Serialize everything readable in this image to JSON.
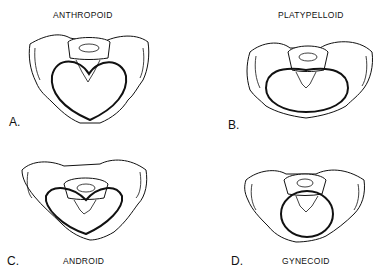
{
  "figure": {
    "panels": [
      {
        "letter": "A.",
        "title": "ANTHROPOID",
        "inlet_shape": "heart-shaped / oval anteroposterior"
      },
      {
        "letter": "B.",
        "title": "PLATYPELLOID",
        "inlet_shape": "wide transverse oval"
      },
      {
        "letter": "C.",
        "title": "ANDROID",
        "inlet_shape": "heart-shaped / triangular"
      },
      {
        "letter": "D.",
        "title": "GYNECOID",
        "inlet_shape": "round"
      }
    ],
    "line_color": "#111111",
    "background": "#ffffff"
  }
}
